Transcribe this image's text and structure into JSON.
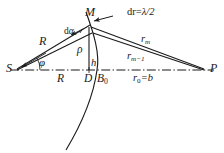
{
  "figure": {
    "type": "geometric-optics-fresnel-zone-diagram",
    "background_color": "#ffffff",
    "line_color": "#1a1a1a",
    "labels": {
      "source_point": "S",
      "screen_point": "P",
      "apex_point": "M",
      "foot_point": "D",
      "axis_point": "B",
      "axis_point_sub": "0",
      "radius_upper": "R",
      "radius_lower": "R",
      "rho": "ρ",
      "height": "h",
      "phi": "φ",
      "d_alpha_d": "d",
      "d_alpha_a": "α",
      "r_m": "r",
      "r_m_sub": "m",
      "r_m1": "r",
      "r_m1_sub": "m−1",
      "r0_head": "r",
      "r0_sub": "0",
      "r0_tail": "=b",
      "dr_head": "dr=",
      "dr_value": "λ/2"
    },
    "geometry": {
      "S": [
        16,
        70
      ],
      "P": [
        205,
        70
      ],
      "M": [
        89,
        26
      ],
      "D": [
        89,
        70
      ],
      "B0": [
        97,
        70
      ],
      "axis_style": "dash-dot",
      "arc_description": "wavefront arc through M and B0 curving down-left"
    }
  }
}
